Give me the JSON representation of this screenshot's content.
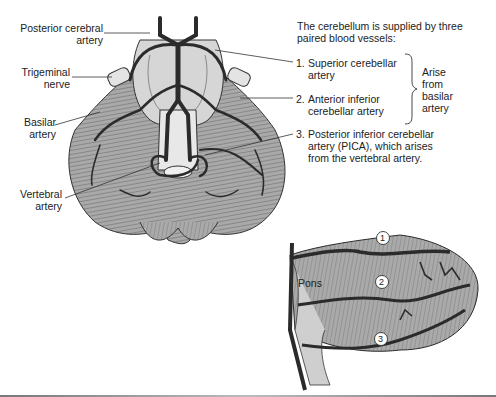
{
  "figure": {
    "left_labels": [
      {
        "id": "posterior-cerebral-artery",
        "lines": [
          "Posterior cerebral",
          "artery"
        ]
      },
      {
        "id": "trigeminal-nerve",
        "lines": [
          "Trigeminal",
          "nerve"
        ]
      },
      {
        "id": "basilar-artery",
        "lines": [
          "Basilar",
          "artery"
        ]
      },
      {
        "id": "vertebral-artery",
        "lines": [
          "Vertebral",
          "artery"
        ]
      }
    ],
    "intro": [
      "The cerebellum is supplied by three",
      "paired blood vessels:"
    ],
    "vessels": [
      {
        "num": "1.",
        "lines": [
          "Superior cerebellar",
          "artery"
        ]
      },
      {
        "num": "2.",
        "lines": [
          "Anterior inferior",
          "cerebellar artery"
        ]
      },
      {
        "num": "3.",
        "lines": [
          "Posterior inferior cerebellar",
          "artery (PICA), which arises",
          "from the vertebral artery."
        ]
      }
    ],
    "brace_note": [
      "Arise",
      "from",
      "basilar",
      "artery"
    ],
    "lateral_view": {
      "structure_label": "Pons",
      "markers": [
        "1",
        "2",
        "3"
      ]
    },
    "colors": {
      "tissue": "#a9a9a9",
      "tissue_light": "#d9d9d9",
      "vessel": "#2b2b2b",
      "text": "#222222"
    }
  }
}
